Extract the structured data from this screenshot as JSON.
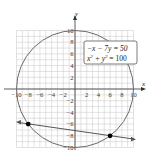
{
  "chart_data": {
    "type": "line",
    "title": "",
    "xlabel": "x",
    "ylabel": "y",
    "xlim": [
      -10,
      10
    ],
    "ylim": [
      -10,
      10
    ],
    "grid": true,
    "x_ticks": [
      "-10",
      "-8",
      "-6",
      "-4",
      "-2",
      "2",
      "4",
      "6",
      "8",
      "10"
    ],
    "y_ticks": [
      "10",
      "8",
      "6",
      "4",
      "2",
      "-2",
      "-4",
      "-6",
      "-8",
      "-10"
    ],
    "legend": [
      "-x - 7y = 50",
      "x² + y² = 100"
    ],
    "series": [
      {
        "name": "x² + y² = 100",
        "kind": "circle",
        "center": [
          0,
          0
        ],
        "radius": 10
      },
      {
        "name": "-x - 7y = 50",
        "kind": "line",
        "points": [
          [
            -10,
            -5.714
          ],
          [
            10,
            -8.571
          ]
        ]
      }
    ],
    "intersections": [
      [
        -8,
        -6
      ],
      [
        6,
        -8
      ]
    ]
  },
  "legend": {
    "eq1": "−x − 7y = 50",
    "eq2_base": "x",
    "eq2_mid": " + y",
    "eq2_end": " = 100",
    "sup": "2"
  },
  "axes": {
    "x_label": "x",
    "y_label": "y"
  },
  "colors": {
    "circle": "#666666",
    "line": "#555555",
    "grid": "#cccccc",
    "point": "#000000"
  }
}
